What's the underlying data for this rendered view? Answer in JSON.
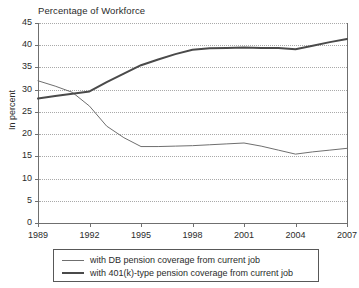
{
  "chart_data": {
    "type": "line",
    "title": "Percentage of Workforce",
    "xlabel": "",
    "ylabel": "In percent",
    "ylim": [
      0,
      45
    ],
    "xlim": [
      1989,
      2007
    ],
    "ytick_step": 5,
    "yticks": [
      "45",
      "40",
      "35",
      "30",
      "25",
      "20",
      "15",
      "10",
      "5",
      "0"
    ],
    "xticks": [
      "1989",
      "1992",
      "1995",
      "1998",
      "2001",
      "2004",
      "2007"
    ],
    "x": [
      1989,
      1990,
      1991,
      1992,
      1993,
      1994,
      1995,
      1996,
      1997,
      1998,
      1999,
      2000,
      2001,
      2002,
      2003,
      2004,
      2005,
      2006,
      2007
    ],
    "grid": "horizontal-dotted",
    "legend_position": "below-plot",
    "series": [
      {
        "name": "with DB pension coverage from current job",
        "key": "db",
        "color": "#6f6f6f",
        "width": 1,
        "values": [
          32.0,
          30.8,
          29.4,
          26.3,
          21.8,
          19.2,
          17.2,
          17.2,
          17.3,
          17.4,
          17.6,
          17.8,
          18.0,
          17.3,
          16.4,
          15.5,
          16.0,
          16.4,
          16.8
        ]
      },
      {
        "name": "with 401(k)-type pension coverage from current job",
        "key": "k401",
        "color": "#4a4a4a",
        "width": 2,
        "values": [
          28.0,
          28.6,
          29.1,
          29.6,
          31.7,
          33.6,
          35.5,
          36.8,
          38.0,
          39.0,
          39.3,
          39.4,
          39.5,
          39.4,
          39.4,
          39.1,
          39.9,
          40.7,
          41.4
        ]
      }
    ]
  },
  "legend": {
    "items": [
      {
        "label": "with DB pension coverage from current job"
      },
      {
        "label": "with 401(k)-type pension coverage from current job"
      }
    ]
  }
}
